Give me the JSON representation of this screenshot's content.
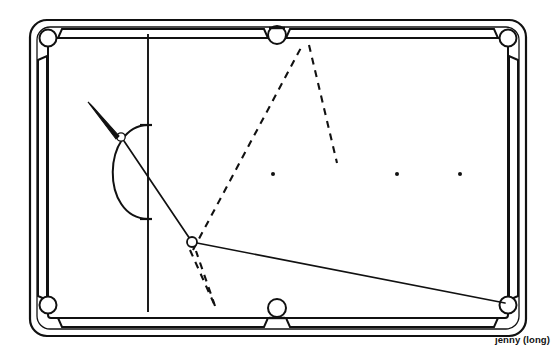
{
  "caption": {
    "text": "jenny (long)"
  },
  "diagram": {
    "title": "jenny (long)",
    "type": "billiards-shot-diagram",
    "colors": {
      "line": "#111111",
      "cloth": "#ffffff",
      "rail": "#111111",
      "background": "#ffffff"
    },
    "table": {
      "outer": {
        "x": 30,
        "y": 20,
        "width": 496,
        "height": 316,
        "corner_radius": 16
      },
      "inner_cloth": {
        "x": 48,
        "y": 38,
        "width": 460,
        "height": 280
      },
      "rail_thickness": 9
    },
    "pockets": [
      {
        "name": "top-left-corner",
        "cx": 48,
        "cy": 38,
        "r": 8.5
      },
      {
        "name": "top-side",
        "cx": 277,
        "cy": 35,
        "r": 9
      },
      {
        "name": "top-right-corner",
        "cx": 508,
        "cy": 38,
        "r": 8.5
      },
      {
        "name": "bottom-left-corner",
        "cx": 48,
        "cy": 305,
        "r": 8.5
      },
      {
        "name": "bottom-side",
        "cx": 277,
        "cy": 308,
        "r": 9
      },
      {
        "name": "bottom-right-corner",
        "cx": 508,
        "cy": 305,
        "r": 8.5
      }
    ],
    "head_string": {
      "x": 148,
      "y1": 34,
      "y2": 312
    },
    "kitchen_arc": {
      "cx": 148,
      "cy": 172,
      "rx": 45,
      "ry": 47,
      "start_y": 125,
      "end_y": 219
    },
    "spots": [
      {
        "name": "spot-1",
        "cx": 273,
        "cy": 174,
        "r": 2
      },
      {
        "name": "spot-2",
        "cx": 397,
        "cy": 174,
        "r": 2
      },
      {
        "name": "spot-3",
        "cx": 460,
        "cy": 174,
        "r": 2
      }
    ],
    "balls": [
      {
        "name": "cue-ball",
        "cx": 121,
        "cy": 137,
        "r": 4.2
      },
      {
        "name": "object-ball",
        "cx": 192,
        "cy": 242,
        "r": 5
      }
    ],
    "cue_stick": {
      "name": "cue-stick",
      "tip_x": 116,
      "tip_y": 133,
      "butt_x": 91,
      "butt_y": 105,
      "butt_width": 5.2
    },
    "solid_paths": [
      {
        "name": "cue-to-object-line",
        "points": "123,140 192,242"
      },
      {
        "name": "object-to-corner-line",
        "points": "197,243 506,303"
      }
    ],
    "dashed_paths": [
      {
        "name": "bank-line-up-left",
        "points": "193,250 303,44"
      },
      {
        "name": "bank-line-up-right",
        "points": "310,45 337,163"
      },
      {
        "name": "short-v-left",
        "points": "190,249 216,305"
      },
      {
        "name": "short-v-right",
        "points": "216,305 192,250"
      }
    ]
  }
}
